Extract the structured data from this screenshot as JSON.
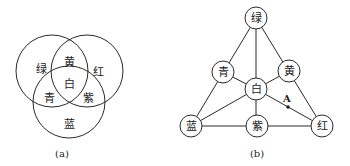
{
  "venn": {
    "caption": "(a)",
    "regions": {
      "green": "绿",
      "yellow": "黄",
      "red": "红",
      "cyan": "青",
      "white": "白",
      "magenta": "紫",
      "blue": "蓝"
    }
  },
  "graph": {
    "caption": "(b)",
    "nodes": {
      "green": "绿",
      "cyan": "青",
      "yellow": "黄",
      "white": "白",
      "blue": "蓝",
      "magenta": "紫",
      "red": "红"
    },
    "point_label": "A"
  },
  "colors": {
    "line": "#2a2a2a",
    "text": "#222222",
    "background": "#ffffff"
  }
}
